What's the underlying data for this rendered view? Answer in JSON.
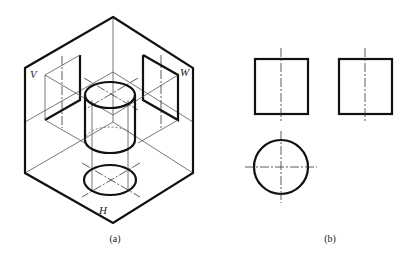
{
  "figure": {
    "panels": [
      {
        "id": "a",
        "caption": "(a)",
        "description": "Isometric view of three-projection-plane box with cylinder projected onto V, W and H planes",
        "plane_labels": {
          "v": "V",
          "w": "W",
          "h": "H"
        }
      },
      {
        "id": "b",
        "caption": "(b)",
        "description": "Three orthographic views of cylinder: front view (rectangle), side view (rectangle), top view (circle)",
        "views": [
          "front-view-rectangle",
          "side-view-rectangle",
          "top-view-circle"
        ]
      }
    ],
    "colors": {
      "line": "#111111",
      "thin_line": "#555555",
      "background": "#ffffff"
    }
  }
}
